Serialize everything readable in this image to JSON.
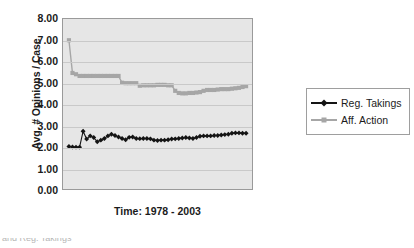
{
  "chart_data": {
    "type": "line",
    "title": "",
    "xlabel": "Time: 1978 - 2003",
    "ylabel": "Avg. # Opinions / Case",
    "ylim": [
      0.0,
      8.0
    ],
    "ytick_labels": [
      "8.00",
      "7.00",
      "6.00",
      "5.00",
      "4.00",
      "3.00",
      "2.00",
      "1.00",
      "0.00"
    ],
    "ytick_values": [
      8,
      7,
      6,
      5,
      4,
      3,
      2,
      1,
      0
    ],
    "grid": true,
    "legend_position": "right",
    "plot_background": "#e6e6e6",
    "x": [
      1978,
      1978.5,
      1979,
      1979.5,
      1980,
      1980.5,
      1981,
      1981.5,
      1982,
      1982.5,
      1983,
      1983.5,
      1984,
      1984.5,
      1985,
      1985.5,
      1986,
      1986.5,
      1987,
      1987.5,
      1988,
      1988.5,
      1989,
      1989.5,
      1990,
      1990.5,
      1991,
      1991.5,
      1992,
      1992.5,
      1993,
      1993.5,
      1994,
      1994.5,
      1995,
      1995.5,
      1996,
      1996.5,
      1997,
      1997.5,
      1998,
      1998.5,
      1999,
      1999.5,
      2000,
      2000.5,
      2001,
      2001.5,
      2002,
      2002.5,
      2003
    ],
    "series": [
      {
        "name": "Reg. Takings",
        "color": "#141414",
        "marker": "diamond",
        "values": [
          2.0,
          1.98,
          1.97,
          1.97,
          2.72,
          2.35,
          2.5,
          2.42,
          2.22,
          2.3,
          2.38,
          2.5,
          2.58,
          2.52,
          2.45,
          2.38,
          2.32,
          2.43,
          2.45,
          2.38,
          2.37,
          2.38,
          2.38,
          2.36,
          2.3,
          2.28,
          2.3,
          2.3,
          2.32,
          2.35,
          2.36,
          2.38,
          2.4,
          2.42,
          2.4,
          2.38,
          2.42,
          2.48,
          2.5,
          2.5,
          2.5,
          2.52,
          2.52,
          2.54,
          2.56,
          2.58,
          2.62,
          2.64,
          2.64,
          2.62,
          2.62
        ]
      },
      {
        "name": "Aff. Action",
        "color": "#a6a6a6",
        "marker": "square",
        "values": [
          7.0,
          5.46,
          5.4,
          5.32,
          5.32,
          5.32,
          5.32,
          5.32,
          5.32,
          5.32,
          5.32,
          5.32,
          5.32,
          5.32,
          5.32,
          5.0,
          4.98,
          4.98,
          4.98,
          4.98,
          4.86,
          4.88,
          4.88,
          4.88,
          4.88,
          4.9,
          4.9,
          4.9,
          4.88,
          4.88,
          4.62,
          4.52,
          4.5,
          4.5,
          4.52,
          4.52,
          4.54,
          4.56,
          4.62,
          4.66,
          4.66,
          4.66,
          4.68,
          4.7,
          4.7,
          4.7,
          4.72,
          4.74,
          4.76,
          4.8,
          4.84
        ]
      }
    ]
  },
  "legend": {
    "items": [
      {
        "label": "Reg. Takings",
        "marker": "diamond-marker",
        "color": "#141414"
      },
      {
        "label": "Aff. Action",
        "marker": "square-marker",
        "color": "#a6a6a6"
      }
    ]
  },
  "footer": {
    "text": "and Reg. Takings"
  }
}
